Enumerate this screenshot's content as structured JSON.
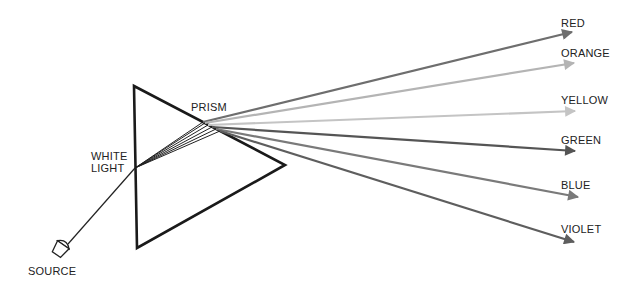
{
  "diagram": {
    "labels": {
      "prism": "PRISM",
      "white_light_line1": "WHITE",
      "white_light_line2": "LIGHT",
      "source": "SOURCE"
    },
    "prism_color": "#1a1a1a",
    "beam_color": "#222222",
    "rays": [
      {
        "name": "RED",
        "color": "#6e6e6e",
        "exit": [
          203,
          122
        ],
        "tip": [
          572,
          32
        ]
      },
      {
        "name": "ORANGE",
        "color": "#b4b4b4",
        "exit": [
          205,
          123
        ],
        "tip": [
          574,
          63
        ]
      },
      {
        "name": "YELLOW",
        "color": "#c4c4c4",
        "exit": [
          208,
          125
        ],
        "tip": [
          575,
          111
        ]
      },
      {
        "name": "GREEN",
        "color": "#555555",
        "exit": [
          212,
          127
        ],
        "tip": [
          575,
          151
        ]
      },
      {
        "name": "BLUE",
        "color": "#7a7a7a",
        "exit": [
          216,
          129
        ],
        "tip": [
          578,
          197
        ]
      },
      {
        "name": "VIOLET",
        "color": "#5e5e5e",
        "exit": [
          220,
          131
        ],
        "tip": [
          574,
          242
        ]
      }
    ]
  }
}
